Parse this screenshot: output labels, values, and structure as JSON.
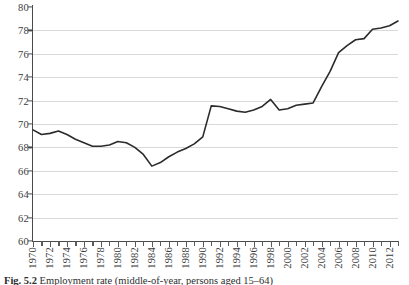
{
  "figure": {
    "caption_label": "Fig. 5.2",
    "caption_text": "Employment rate (middle-of-year, persons aged 15–64)"
  },
  "chart_data": {
    "type": "line",
    "title": "",
    "xlabel": "",
    "ylabel": "",
    "xlim": [
      1970,
      2013
    ],
    "ylim": [
      60,
      80
    ],
    "ytick_step": 2,
    "xtick_step": 2,
    "grid": "horizontal",
    "legend": "none",
    "line_color": "#2b2b2b",
    "grid_color": "#d9d9d9",
    "axis_color": "#4a4a4a",
    "ytick_labels": [
      "60",
      "62",
      "64",
      "66",
      "68",
      "70",
      "72",
      "74",
      "76",
      "78",
      "80"
    ],
    "xtick_labels": [
      "1970",
      "1972",
      "1974",
      "1976",
      "1978",
      "1980",
      "1982",
      "1984",
      "1986",
      "1988",
      "1990",
      "1992",
      "1994",
      "1996",
      "1998",
      "2000",
      "2002",
      "2004",
      "2006",
      "2008",
      "2010",
      "2012"
    ],
    "x": [
      1970,
      1971,
      1972,
      1973,
      1974,
      1975,
      1976,
      1977,
      1978,
      1979,
      1980,
      1981,
      1982,
      1983,
      1984,
      1985,
      1986,
      1987,
      1988,
      1989,
      1990,
      1991,
      1992,
      1993,
      1994,
      1995,
      1996,
      1997,
      1998,
      1999,
      2000,
      2001,
      2002,
      2003,
      2004,
      2005,
      2006,
      2007,
      2008,
      2009,
      2010,
      2011,
      2012,
      2013
    ],
    "values": [
      69.5,
      69.1,
      69.2,
      69.4,
      69.1,
      68.7,
      68.4,
      68.1,
      68.1,
      68.2,
      68.5,
      68.4,
      68.0,
      67.4,
      66.4,
      66.7,
      67.2,
      67.6,
      67.9,
      68.3,
      68.9,
      71.55,
      71.5,
      71.3,
      71.1,
      71.0,
      71.2,
      71.5,
      72.1,
      71.2,
      71.3,
      71.6,
      71.7,
      71.8,
      73.2,
      74.5,
      76.1,
      76.7,
      77.2,
      77.3,
      78.1,
      78.2,
      78.4,
      78.8
    ],
    "series": [
      {
        "name": "employment-rate",
        "values": [
          69.5,
          69.1,
          69.2,
          69.4,
          69.1,
          68.7,
          68.4,
          68.1,
          68.1,
          68.2,
          68.5,
          68.4,
          68.0,
          67.4,
          66.4,
          66.7,
          67.2,
          67.6,
          67.9,
          68.3,
          68.9,
          71.55,
          71.5,
          71.3,
          71.1,
          71.0,
          71.2,
          71.5,
          72.1,
          71.2,
          71.3,
          71.6,
          71.7,
          71.8,
          73.2,
          74.5,
          76.1,
          76.7,
          77.2,
          77.3,
          78.1,
          78.2,
          78.4,
          78.8
        ]
      }
    ],
    "annotations": []
  }
}
